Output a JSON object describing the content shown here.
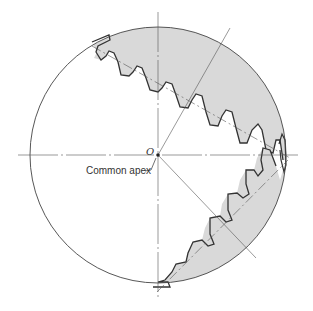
{
  "diagram": {
    "type": "bevel gear pair (section view)",
    "labels": {
      "origin": "O",
      "apex": "Common apex"
    },
    "colors": {
      "gear_fill": "#d9d9d9",
      "outline": "#333333",
      "centerline": "#555555"
    },
    "elements": [
      "bounding circle",
      "horizontal centerline",
      "vertical centerline",
      "upper gear (shaded, toothed)",
      "lower gear (shaded, toothed)",
      "upper gear pitch axis (dash-dot)",
      "lower gear pitch axis (dash-dot)",
      "radial line to upper right",
      "radial line to lower right",
      "common apex point"
    ]
  }
}
